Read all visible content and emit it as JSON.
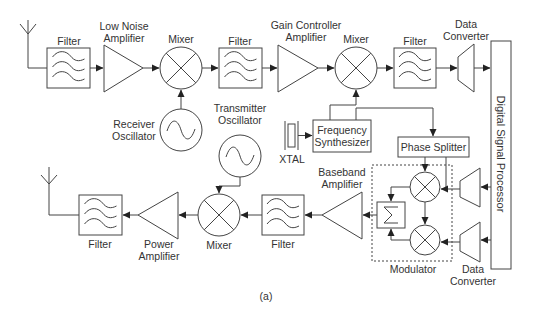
{
  "diagram": {
    "caption": "(a)",
    "colors": {
      "stroke": "#444444",
      "text": "#333333",
      "background": "#ffffff"
    },
    "receive_chain": {
      "filter1": "Filter",
      "lna": "Low Noise Amplifier",
      "lna_line1": "Low Noise",
      "lna_line2": "Amplifier",
      "mixer1": "Mixer",
      "filter2": "Filter",
      "gain_amp_line1": "Gain Controller",
      "gain_amp_line2": "Amplifier",
      "mixer2": "Mixer",
      "filter3": "Filter",
      "data_converter_line1": "Data",
      "data_converter_line2": "Converter"
    },
    "receiver_oscillator_line1": "Receiver",
    "receiver_oscillator_line2": "Oscillator",
    "transmitter_oscillator_line1": "Transmitter",
    "transmitter_oscillator_line2": "Oscillator",
    "xtal": "XTAL",
    "frequency_synthesizer_line1": "Frequency",
    "frequency_synthesizer_line2": "Synthesizer",
    "phase_splitter": "Phase Splitter",
    "dsp": "Digital Signal Processor",
    "modulator": "Modulator",
    "modulator_sum_symbol": "Σ",
    "transmit_chain": {
      "data_converter_line1": "Data",
      "data_converter_line2": "Converter",
      "baseband_amp_line1": "Baseband",
      "baseband_amp_line2": "Amplifier",
      "filter": "Filter",
      "mixer": "Mixer",
      "power_amp_line1": "Power",
      "power_amp_line2": "Amplifier",
      "filter_out": "Filter"
    }
  }
}
